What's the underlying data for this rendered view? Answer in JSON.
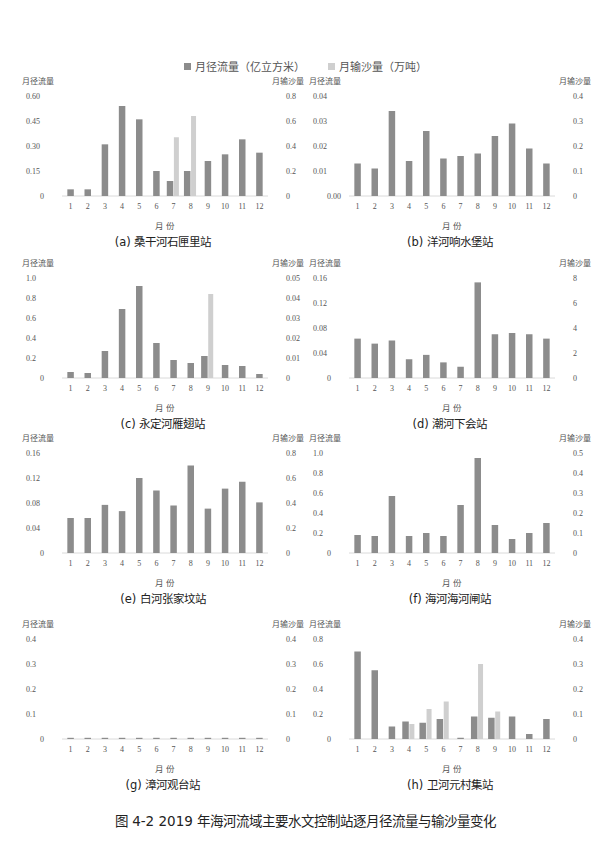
{
  "legend": {
    "runoff_label": "月径流量（亿立方米）",
    "sediment_label": "月输沙量（万吨）",
    "runoff_color": "#8c8c8c",
    "sediment_color": "#cfcfcf"
  },
  "caption": "图 4-2   2019 年海河流域主要水文控制站逐月径流量与输沙量变化",
  "chart_data": [
    {
      "type": "bar",
      "title": "(a) 桑干河石匣里站",
      "xlabel": "月 份",
      "ylabel": "月径流量",
      "y2label": "月输沙量",
      "categories": [
        "1",
        "2",
        "3",
        "4",
        "5",
        "6",
        "7",
        "8",
        "9",
        "10",
        "11",
        "12"
      ],
      "left_ticks": [
        "0",
        "0.15",
        "0.30",
        "0.45",
        "0.60"
      ],
      "right_ticks": [
        "0",
        "0.2",
        "0.4",
        "0.6",
        "0.8"
      ],
      "ylim": [
        0,
        0.6
      ],
      "y2lim": [
        0,
        0.8
      ],
      "series": [
        {
          "name": "月径流量（亿立方米）",
          "axis": "left",
          "values": [
            0.04,
            0.04,
            0.31,
            0.54,
            0.46,
            0.15,
            0.09,
            0.15,
            0.21,
            0.25,
            0.34,
            0.26
          ]
        },
        {
          "name": "月输沙量（万吨）",
          "axis": "right",
          "values": [
            0,
            0,
            0,
            0,
            0,
            0,
            0.47,
            0.64,
            0,
            0,
            0,
            0
          ]
        }
      ]
    },
    {
      "type": "bar",
      "title": "(b) 洋河响水堡站",
      "xlabel": "月 份",
      "ylabel": "月径流量",
      "y2label": "月输沙量",
      "categories": [
        "1",
        "2",
        "3",
        "4",
        "5",
        "6",
        "7",
        "8",
        "9",
        "10",
        "11",
        "12"
      ],
      "left_ticks": [
        "0.00",
        "0.01",
        "0.02",
        "0.03",
        "0.04"
      ],
      "right_ticks": [
        "0",
        "0.1",
        "0.2",
        "0.3",
        "0.4"
      ],
      "ylim": [
        0,
        0.04
      ],
      "y2lim": [
        0,
        0.4
      ],
      "series": [
        {
          "name": "月径流量（亿立方米）",
          "axis": "left",
          "values": [
            0.013,
            0.011,
            0.034,
            0.014,
            0.026,
            0.015,
            0.016,
            0.017,
            0.024,
            0.029,
            0.019,
            0.013
          ]
        },
        {
          "name": "月输沙量（万吨）",
          "axis": "right",
          "values": [
            0,
            0,
            0,
            0,
            0,
            0,
            0,
            0,
            0,
            0,
            0,
            0
          ]
        }
      ]
    },
    {
      "type": "bar",
      "title": "(c) 永定河雁翅站",
      "xlabel": "月 份",
      "ylabel": "月径流量",
      "y2label": "月输沙量",
      "categories": [
        "1",
        "2",
        "3",
        "4",
        "5",
        "6",
        "7",
        "8",
        "9",
        "10",
        "11",
        "12"
      ],
      "left_ticks": [
        "0",
        "0.2",
        "0.4",
        "0.6",
        "0.8",
        "1.0"
      ],
      "right_ticks": [
        "0",
        "0.01",
        "0.02",
        "0.03",
        "0.04",
        "0.05"
      ],
      "ylim": [
        0,
        1.0
      ],
      "y2lim": [
        0,
        0.05
      ],
      "series": [
        {
          "name": "月径流量（亿立方米）",
          "axis": "left",
          "values": [
            0.06,
            0.05,
            0.27,
            0.69,
            0.92,
            0.35,
            0.18,
            0.15,
            0.22,
            0.13,
            0.12,
            0.04
          ]
        },
        {
          "name": "月输沙量（万吨）",
          "axis": "right",
          "values": [
            0,
            0,
            0,
            0,
            0,
            0,
            0,
            0,
            0.042,
            0,
            0,
            0
          ]
        }
      ]
    },
    {
      "type": "bar",
      "title": "(d) 潮河下会站",
      "xlabel": "月 份",
      "ylabel": "月径流量",
      "y2label": "月输沙量",
      "categories": [
        "1",
        "2",
        "3",
        "4",
        "5",
        "6",
        "7",
        "8",
        "9",
        "10",
        "11",
        "12"
      ],
      "left_ticks": [
        "0",
        "0.04",
        "0.08",
        "0.12",
        "0.16"
      ],
      "right_ticks": [
        "0",
        "2",
        "4",
        "6",
        "8"
      ],
      "ylim": [
        0,
        0.16
      ],
      "y2lim": [
        0,
        8
      ],
      "series": [
        {
          "name": "月径流量（亿立方米）",
          "axis": "left",
          "values": [
            0.063,
            0.055,
            0.06,
            0.03,
            0.037,
            0.025,
            0.018,
            0.153,
            0.07,
            0.072,
            0.07,
            0.063
          ]
        },
        {
          "name": "月输沙量（万吨）",
          "axis": "right",
          "values": [
            0,
            0,
            0,
            0,
            0,
            0,
            0,
            0,
            0,
            0,
            0,
            0
          ]
        }
      ]
    },
    {
      "type": "bar",
      "title": "(e) 白河张家坟站",
      "xlabel": "月 份",
      "ylabel": "月径流量",
      "y2label": "月输沙量",
      "categories": [
        "1",
        "2",
        "3",
        "4",
        "5",
        "6",
        "7",
        "8",
        "9",
        "10",
        "11",
        "12"
      ],
      "left_ticks": [
        "0",
        "0.04",
        "0.08",
        "0.12",
        "0.16"
      ],
      "right_ticks": [
        "0",
        "0.2",
        "0.4",
        "0.6",
        "0.8"
      ],
      "ylim": [
        0,
        0.16
      ],
      "y2lim": [
        0,
        0.8
      ],
      "series": [
        {
          "name": "月径流量（亿立方米）",
          "axis": "left",
          "values": [
            0.056,
            0.056,
            0.077,
            0.067,
            0.12,
            0.1,
            0.076,
            0.14,
            0.071,
            0.103,
            0.114,
            0.081
          ]
        },
        {
          "name": "月输沙量（万吨）",
          "axis": "right",
          "values": [
            0,
            0,
            0,
            0,
            0,
            0,
            0,
            0,
            0,
            0,
            0,
            0
          ]
        }
      ]
    },
    {
      "type": "bar",
      "title": "(f) 海河海河闸站",
      "xlabel": "月 份",
      "ylabel": "月径流量",
      "y2label": "月输沙量",
      "categories": [
        "1",
        "2",
        "3",
        "4",
        "5",
        "6",
        "7",
        "8",
        "9",
        "10",
        "11",
        "12"
      ],
      "left_ticks": [
        "0",
        "0.2",
        "0.4",
        "0.6",
        "0.8",
        "1.0"
      ],
      "right_ticks": [
        "0",
        "0.1",
        "0.2",
        "0.3",
        "0.4",
        "0.5"
      ],
      "ylim": [
        0,
        1.0
      ],
      "y2lim": [
        0,
        0.5
      ],
      "series": [
        {
          "name": "月径流量（亿立方米）",
          "axis": "left",
          "values": [
            0.18,
            0.17,
            0.57,
            0.17,
            0.2,
            0.17,
            0.48,
            0.95,
            0.28,
            0.14,
            0.2,
            0.3
          ]
        },
        {
          "name": "月输沙量（万吨）",
          "axis": "right",
          "values": [
            0,
            0,
            0,
            0,
            0,
            0,
            0,
            0,
            0,
            0,
            0,
            0
          ]
        }
      ]
    },
    {
      "type": "bar",
      "title": "(g) 漳河观台站",
      "xlabel": "月 份",
      "ylabel": "月径流量",
      "y2label": "月输沙量",
      "categories": [
        "1",
        "2",
        "3",
        "4",
        "5",
        "6",
        "7",
        "8",
        "9",
        "10",
        "11",
        "12"
      ],
      "left_ticks": [
        "0",
        "0.1",
        "0.2",
        "0.3",
        "0.4"
      ],
      "right_ticks": [
        "0",
        "0.1",
        "0.2",
        "0.3",
        "0.4"
      ],
      "ylim": [
        0,
        0.4
      ],
      "y2lim": [
        0,
        0.4
      ],
      "series": [
        {
          "name": "月径流量（亿立方米）",
          "axis": "left",
          "values": [
            0.002,
            0.002,
            0.002,
            0.002,
            0.002,
            0.002,
            0.002,
            0.002,
            0.002,
            0.002,
            0.002,
            0.002
          ]
        },
        {
          "name": "月输沙量（万吨）",
          "axis": "right",
          "values": [
            0,
            0,
            0,
            0,
            0,
            0,
            0,
            0,
            0,
            0,
            0,
            0
          ]
        }
      ]
    },
    {
      "type": "bar",
      "title": "(h) 卫河元村集站",
      "xlabel": "月 份",
      "ylabel": "月径流量",
      "y2label": "月输沙量",
      "categories": [
        "1",
        "2",
        "3",
        "4",
        "5",
        "6",
        "7",
        "8",
        "9",
        "10",
        "11",
        "12"
      ],
      "left_ticks": [
        "0",
        "0.2",
        "0.4",
        "0.6",
        "0.8"
      ],
      "right_ticks": [
        "0",
        "0.1",
        "0.2",
        "0.3",
        "0.4"
      ],
      "ylim": [
        0,
        0.8
      ],
      "y2lim": [
        0,
        0.4
      ],
      "series": [
        {
          "name": "月径流量（亿立方米）",
          "axis": "left",
          "values": [
            0.7,
            0.55,
            0.1,
            0.14,
            0.13,
            0.16,
            0.01,
            0.18,
            0.17,
            0.18,
            0.04,
            0.16
          ]
        },
        {
          "name": "月输沙量（万吨）",
          "axis": "right",
          "values": [
            0,
            0,
            0,
            0.06,
            0.12,
            0.15,
            0,
            0.3,
            0.11,
            0,
            0,
            0
          ]
        }
      ]
    }
  ]
}
